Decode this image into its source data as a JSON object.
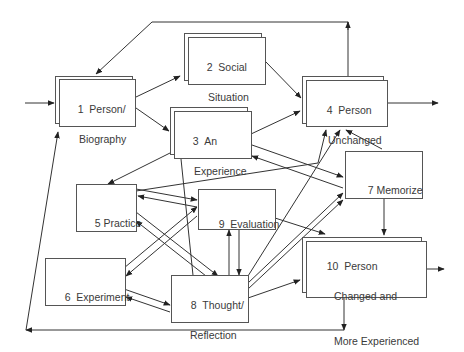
{
  "diagram": {
    "title": "",
    "nodes": [
      {
        "id": "1",
        "number": "1",
        "line1": "Person/",
        "line2": "Biography",
        "line3": "",
        "stacked": true
      },
      {
        "id": "2",
        "number": "2",
        "line1": "Social",
        "line2": "Situation",
        "line3": "",
        "stacked": true
      },
      {
        "id": "3",
        "number": "3",
        "line1": "An",
        "line2": "Experience",
        "line3": "",
        "stacked": true
      },
      {
        "id": "4",
        "number": "4",
        "line1": "Person",
        "line2": "Unchanged",
        "line3": "",
        "stacked": true
      },
      {
        "id": "5",
        "number": "5",
        "line1": "Practice",
        "line2": "",
        "line3": "",
        "stacked": false
      },
      {
        "id": "6",
        "number": "6",
        "line1": "Experiment",
        "line2": "",
        "line3": "",
        "stacked": false
      },
      {
        "id": "7",
        "number": "7",
        "line1": "Memorize",
        "line2": "",
        "line3": "",
        "stacked": false
      },
      {
        "id": "8",
        "number": "8",
        "line1": "Thought/",
        "line2": "Reflection",
        "line3": "",
        "stacked": false
      },
      {
        "id": "9",
        "number": "9",
        "line1": "Evaluation",
        "line2": "",
        "line3": "",
        "stacked": false
      },
      {
        "id": "10",
        "number": "10",
        "line1": "Person",
        "line2": "Changed and",
        "line3": "More Experienced",
        "stacked": true
      }
    ],
    "edges": [
      [
        "input",
        "1"
      ],
      [
        "1",
        "2"
      ],
      [
        "1",
        "3"
      ],
      [
        "2",
        "4"
      ],
      [
        "3",
        "4"
      ],
      [
        "3",
        "5"
      ],
      [
        "3",
        "7"
      ],
      [
        "7",
        "3"
      ],
      [
        "3",
        "8"
      ],
      [
        "5",
        "4"
      ],
      [
        "5",
        "9"
      ],
      [
        "9",
        "5"
      ],
      [
        "5",
        "8"
      ],
      [
        "8",
        "5"
      ],
      [
        "6",
        "9"
      ],
      [
        "9",
        "6"
      ],
      [
        "6",
        "8"
      ],
      [
        "8",
        "6"
      ],
      [
        "9",
        "8"
      ],
      [
        "8",
        "9"
      ],
      [
        "9",
        "10"
      ],
      [
        "8",
        "4"
      ],
      [
        "8",
        "7"
      ],
      [
        "8",
        "10"
      ],
      [
        "7",
        "4"
      ],
      [
        "7",
        "10"
      ],
      [
        "4",
        "output"
      ],
      [
        "10",
        "output"
      ],
      [
        "4",
        "1"
      ],
      [
        "10",
        "1"
      ]
    ],
    "line_color": "#333333",
    "box_border_color": "#555555"
  }
}
